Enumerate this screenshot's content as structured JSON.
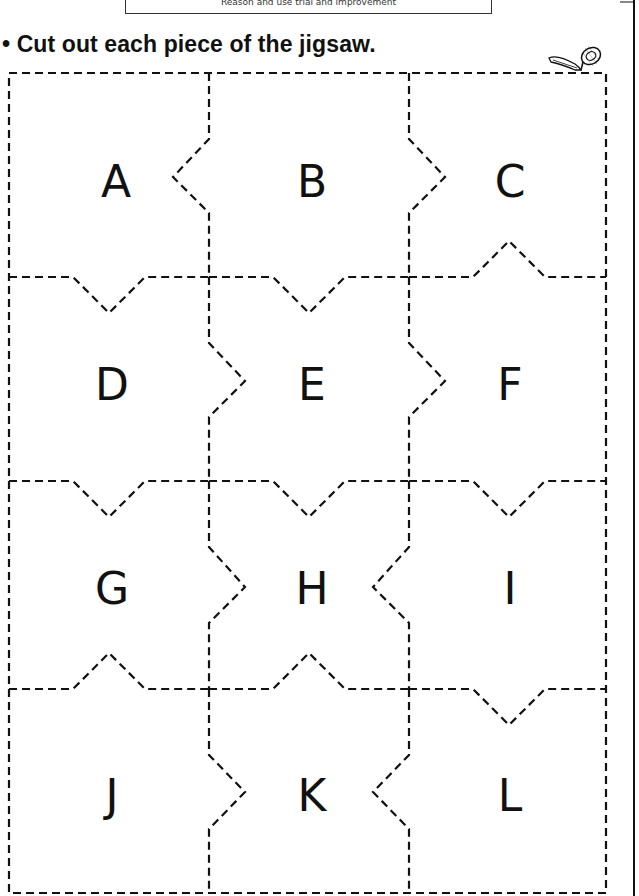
{
  "header": {
    "objective": "Reason and use trial and improvement"
  },
  "instruction": {
    "bullet": "•",
    "text": "Cut out each piece of the jigsaw."
  },
  "icons": {
    "scissors": "scissors-icon"
  },
  "colors": {
    "ink": "#111111",
    "background": "#ffffff"
  },
  "puzzle": {
    "rows": 4,
    "columns": 3,
    "pieces": [
      {
        "label": "A",
        "row": 1,
        "col": 1,
        "cx": 116,
        "cy": 182
      },
      {
        "label": "B",
        "row": 1,
        "col": 2,
        "cx": 312,
        "cy": 182
      },
      {
        "label": "C",
        "row": 1,
        "col": 3,
        "cx": 510,
        "cy": 182
      },
      {
        "label": "D",
        "row": 2,
        "col": 1,
        "cx": 112,
        "cy": 385
      },
      {
        "label": "E",
        "row": 2,
        "col": 2,
        "cx": 312,
        "cy": 385
      },
      {
        "label": "F",
        "row": 2,
        "col": 3,
        "cx": 510,
        "cy": 385
      },
      {
        "label": "G",
        "row": 3,
        "col": 1,
        "cx": 112,
        "cy": 589
      },
      {
        "label": "H",
        "row": 3,
        "col": 2,
        "cx": 312,
        "cy": 589
      },
      {
        "label": "I",
        "row": 3,
        "col": 3,
        "cx": 510,
        "cy": 589
      },
      {
        "label": "J",
        "row": 4,
        "col": 1,
        "cx": 112,
        "cy": 796
      },
      {
        "label": "K",
        "row": 4,
        "col": 2,
        "cx": 312,
        "cy": 796
      },
      {
        "label": "L",
        "row": 4,
        "col": 3,
        "cx": 510,
        "cy": 796
      }
    ]
  }
}
